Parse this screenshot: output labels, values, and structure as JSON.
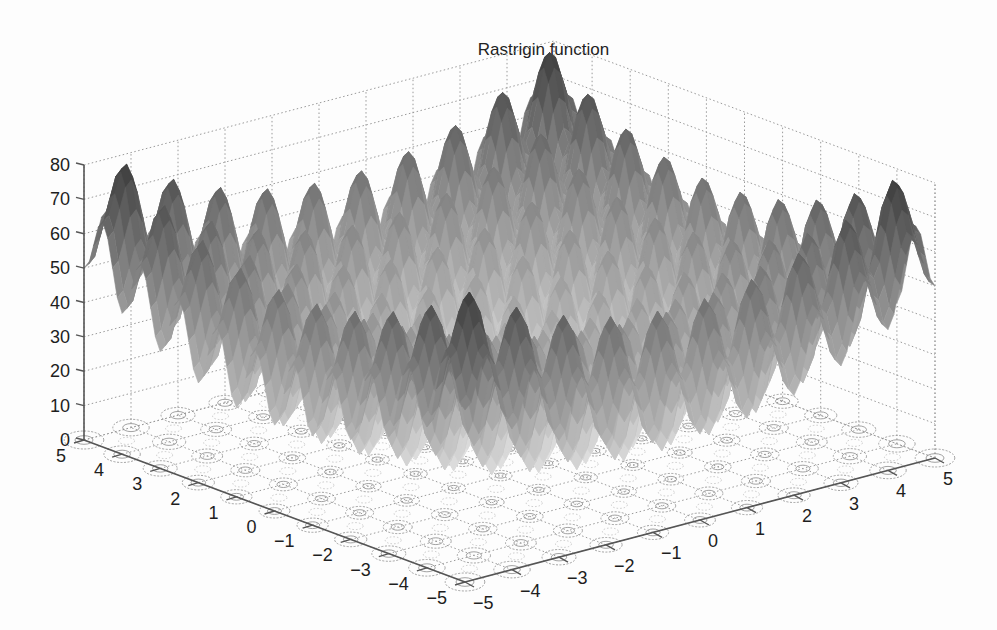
{
  "chart_data": {
    "type": "surface",
    "title": "Rastrigin function",
    "function": "z = 20 + x^2 + y^2 - 10(cos(2πx) + cos(2πy))",
    "xlabel": "",
    "ylabel": "",
    "zlabel": "",
    "xlim": [
      -5,
      5
    ],
    "ylim": [
      -5,
      5
    ],
    "zlim": [
      0,
      80
    ],
    "x_ticks": [
      -5,
      -4,
      -3,
      -2,
      -1,
      0,
      1,
      2,
      3,
      4,
      5
    ],
    "y_ticks": [
      5,
      4,
      3,
      2,
      1,
      0,
      -1,
      -2,
      -3,
      -4,
      -5
    ],
    "z_ticks": [
      0,
      10,
      20,
      30,
      40,
      50,
      60,
      70,
      80
    ],
    "x_tick_labels": [
      "−5",
      "−4",
      "−3",
      "−2",
      "−1",
      "0",
      "1",
      "2",
      "3",
      "4",
      "5"
    ],
    "y_tick_labels": [
      "5",
      "4",
      "3",
      "2",
      "1",
      "0",
      "−1",
      "−2",
      "−3",
      "−4",
      "−5"
    ],
    "z_tick_labels": [
      "0",
      "10",
      "20",
      "30",
      "40",
      "50",
      "60",
      "70",
      "80"
    ],
    "grid": true,
    "colormap": "gray",
    "contour_projection": "floor",
    "max_value_approx": 80.5,
    "min_value": 0
  },
  "colors": {
    "axis": "#555555",
    "grid": "#9a9a9a",
    "contour": "#8a8a8a",
    "surface_dark": "#3c3c3c",
    "surface_light": "#e4e4e4"
  }
}
